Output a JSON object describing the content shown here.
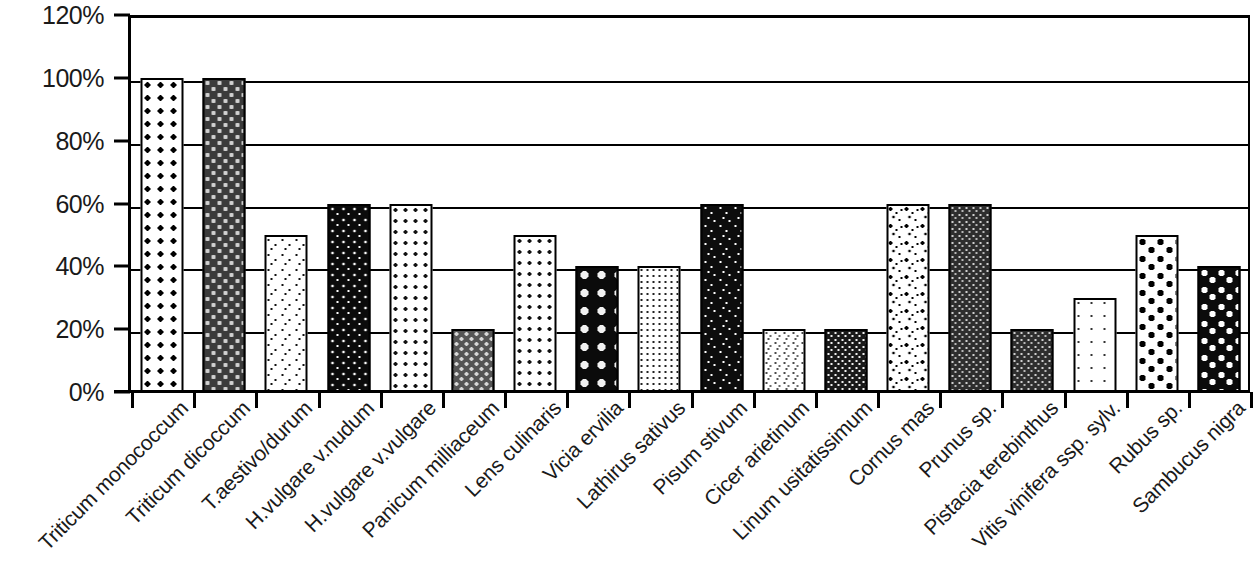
{
  "chart_data": {
    "type": "bar",
    "title": "",
    "xlabel": "",
    "ylabel": "",
    "ylim": [
      0,
      120
    ],
    "grid": true,
    "legend": "none",
    "y_ticks": [
      "0%",
      "20%",
      "40%",
      "60%",
      "80%",
      "100%",
      "120%"
    ],
    "y_tick_values": [
      0,
      20,
      40,
      60,
      80,
      100,
      120
    ],
    "categories": [
      "Triticum monococcum",
      "Triticum dicoccum",
      "T.aestivo/durum",
      "H.vulgare v.nudum",
      "H.vulgare v.vulgare",
      "Panicum milliaceum",
      "Lens culinaris",
      "Vicia ervilia",
      "Lathirus sativus",
      "Pisum stivum",
      "Cicer arietinum",
      "Linum usitatissimum",
      "Cornus mas",
      "Prunus sp.",
      "Pistacia terebinthus",
      "Vitis vinifera ssp. sylv.",
      "Rubus sp.",
      "Sambucus nigra"
    ],
    "values": [
      100,
      100,
      50,
      60,
      60,
      20,
      50,
      40,
      40,
      60,
      20,
      20,
      60,
      60,
      20,
      30,
      50,
      40
    ],
    "value_labels": [
      "100%",
      "100%",
      "50%",
      "60%",
      "60%",
      "20%",
      "50%",
      "40%",
      "40%",
      "60%",
      "20%",
      "20%",
      "60%",
      "60%",
      "20%",
      "30%",
      "50%",
      "40%"
    ],
    "bar_patterns": [
      "p-open-circles-lg",
      "p-dark-rings",
      "p-fine-speckle",
      "p-black-white-dots",
      "p-open-circles-sm",
      "p-gray-rings",
      "p-open-circles-sm",
      "p-black-rings",
      "p-dot-grid",
      "p-black-speckle",
      "p-light-stipple",
      "p-dark-dotgrid",
      "p-black-pepper",
      "p-dark-checker",
      "p-dark-checker",
      "p-sparse-dots",
      "p-big-black-dots",
      "p-big-white-dots"
    ],
    "colors": {
      "axis": "#000000",
      "gridline": "#000000",
      "background": "#ffffff",
      "text": "#1a1a1a"
    }
  }
}
